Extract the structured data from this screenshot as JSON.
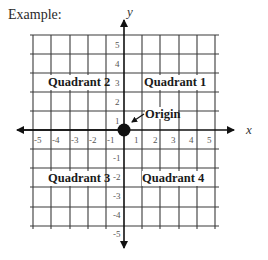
{
  "title": "Example:",
  "axes": {
    "x_label": "x",
    "y_label": "y",
    "x_ticks": [
      "-5",
      "-4",
      "-3",
      "-2",
      "-1",
      "1",
      "2",
      "3",
      "4",
      "5"
    ],
    "y_ticks": [
      "5",
      "4",
      "3",
      "2",
      "1",
      "-1",
      "-2",
      "-3",
      "-4",
      "-5"
    ]
  },
  "quadrants": {
    "q1": "Quadrant 1",
    "q2": "Quadrant 2",
    "q3": "Quadrant 3",
    "q4": "Quadrant 4"
  },
  "origin": {
    "label": "Origin"
  },
  "colors": {
    "grid": "#3a3a3a",
    "axis": "#111111",
    "dot": "#111111"
  }
}
